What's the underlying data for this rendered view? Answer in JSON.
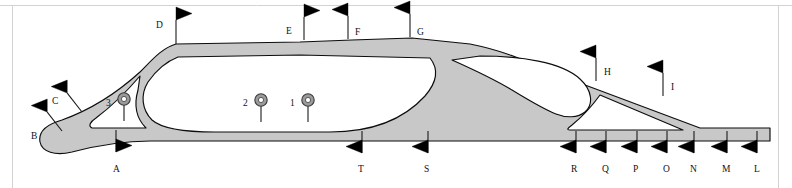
{
  "figure": {
    "background_color": "#ffffff",
    "shape_fill_color": "#c8c8c8",
    "shape_outline_color": "#0d0d0d",
    "flag_color": "#000000",
    "circle_marker_color": "#9a9a9a",
    "frame_color": "#d2d2d2"
  },
  "flag_markers": [
    {
      "id": "flag-a",
      "label": "A",
      "x": 116,
      "y": 130,
      "direction": "right",
      "side": "below",
      "label_x": 113,
      "label_y": 172,
      "pole_len": 22,
      "tilt": 0
    },
    {
      "id": "flag-b",
      "label": "B",
      "x": 62,
      "y": 131,
      "direction": "left",
      "side": "left",
      "label_x": 31,
      "label_y": 139,
      "pole_len": 24,
      "tilt": -38
    },
    {
      "id": "flag-c",
      "label": "C",
      "x": 82,
      "y": 112,
      "direction": "left",
      "side": "left",
      "label_x": 52,
      "label_y": 104,
      "pole_len": 24,
      "tilt": -38
    },
    {
      "id": "flag-d",
      "label": "D",
      "x": 176,
      "y": 44,
      "direction": "right",
      "side": "left",
      "label_x": 156,
      "label_y": 28,
      "pole_len": 24,
      "tilt": 0
    },
    {
      "id": "flag-e",
      "label": "E",
      "x": 304,
      "y": 40,
      "direction": "right",
      "side": "left",
      "label_x": 286,
      "label_y": 34,
      "pole_len": 23,
      "tilt": 0
    },
    {
      "id": "flag-f",
      "label": "F",
      "x": 348,
      "y": 39,
      "direction": "left",
      "side": "right",
      "label_x": 355,
      "label_y": 35,
      "pole_len": 23,
      "tilt": 0
    },
    {
      "id": "flag-g",
      "label": "G",
      "x": 410,
      "y": 37,
      "direction": "left",
      "side": "right",
      "label_x": 417,
      "label_y": 35,
      "pole_len": 23,
      "tilt": 0
    },
    {
      "id": "flag-h",
      "label": "H",
      "x": 596,
      "y": 81,
      "direction": "left",
      "side": "right",
      "label_x": 604,
      "label_y": 75,
      "pole_len": 23,
      "tilt": 0
    },
    {
      "id": "flag-i",
      "label": "I",
      "x": 663,
      "y": 96,
      "direction": "left",
      "side": "right",
      "label_x": 671,
      "label_y": 90,
      "pole_len": 23,
      "tilt": 0
    },
    {
      "id": "flag-l",
      "label": "L",
      "x": 757,
      "y": 131,
      "direction": "left",
      "side": "below",
      "label_x": 754,
      "label_y": 172,
      "pole_len": 22,
      "tilt": 0
    },
    {
      "id": "flag-m",
      "label": "M",
      "x": 727,
      "y": 131,
      "direction": "left",
      "side": "below",
      "label_x": 722,
      "label_y": 172,
      "pole_len": 22,
      "tilt": 0
    },
    {
      "id": "flag-n",
      "label": "N",
      "x": 694,
      "y": 131,
      "direction": "left",
      "side": "below",
      "label_x": 690,
      "label_y": 172,
      "pole_len": 22,
      "tilt": 0
    },
    {
      "id": "flag-o",
      "label": "O",
      "x": 667,
      "y": 131,
      "direction": "left",
      "side": "below",
      "label_x": 663,
      "label_y": 172,
      "pole_len": 22,
      "tilt": 0
    },
    {
      "id": "flag-p",
      "label": "P",
      "x": 637,
      "y": 131,
      "direction": "left",
      "side": "below",
      "label_x": 633,
      "label_y": 172,
      "pole_len": 22,
      "tilt": 0
    },
    {
      "id": "flag-q",
      "label": "Q",
      "x": 606,
      "y": 131,
      "direction": "left",
      "side": "below",
      "label_x": 602,
      "label_y": 172,
      "pole_len": 22,
      "tilt": 0
    },
    {
      "id": "flag-r",
      "label": "R",
      "x": 576,
      "y": 131,
      "direction": "left",
      "side": "below",
      "label_x": 571,
      "label_y": 172,
      "pole_len": 22,
      "tilt": 0
    },
    {
      "id": "flag-s",
      "label": "S",
      "x": 428,
      "y": 131,
      "direction": "left",
      "side": "below",
      "label_x": 424,
      "label_y": 172,
      "pole_len": 22,
      "tilt": 0
    },
    {
      "id": "flag-t",
      "label": "T",
      "x": 362,
      "y": 131,
      "direction": "left",
      "side": "below",
      "label_x": 358,
      "label_y": 172,
      "pole_len": 22,
      "tilt": 0
    }
  ],
  "circle_markers": [
    {
      "id": "circle-1",
      "label": "1",
      "x": 308,
      "y": 100,
      "label_x": 290,
      "label_y": 106,
      "pole_len": 22
    },
    {
      "id": "circle-2",
      "label": "2",
      "x": 261,
      "y": 100,
      "label_x": 243,
      "label_y": 106,
      "pole_len": 22
    },
    {
      "id": "circle-3",
      "label": "3",
      "x": 124,
      "y": 99,
      "label_x": 106,
      "label_y": 106,
      "pole_len": 22
    }
  ]
}
